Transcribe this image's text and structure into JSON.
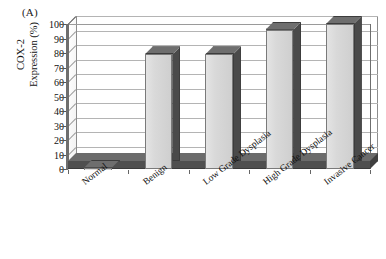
{
  "panel": {
    "label": "(A)"
  },
  "axes": {
    "y_title_line1": "COX-2",
    "y_title_line2": "Expression (%)",
    "y_ticks": [
      "100",
      "90",
      "80",
      "70",
      "60",
      "50",
      "40",
      "30",
      "20",
      "10",
      "0"
    ]
  },
  "colors": {
    "bar_face": "#d9d9d9",
    "bar_side": "#4a4a4a",
    "bar_top": "#6e6e6e",
    "gridline": "#b4b4b4",
    "frame": "#6e6e6e",
    "floor": "#5c5c5c",
    "text": "#111111",
    "background": "#ffffff"
  },
  "chart_data": {
    "type": "bar",
    "title": "",
    "subtitle": "",
    "xlabel": "",
    "ylabel": "COX-2 Expression (%)",
    "ylim": [
      0,
      100
    ],
    "ytick_step": 10,
    "grid": true,
    "legend": "none",
    "three_d": true,
    "categories": [
      "Normal",
      "Benign",
      "Low Grade Dysplasia",
      "High Grade Dysplasia",
      "Invasive Cancer"
    ],
    "values": [
      1,
      79,
      79,
      96,
      100
    ],
    "value_labels": [
      "",
      "",
      "",
      "",
      ""
    ]
  }
}
